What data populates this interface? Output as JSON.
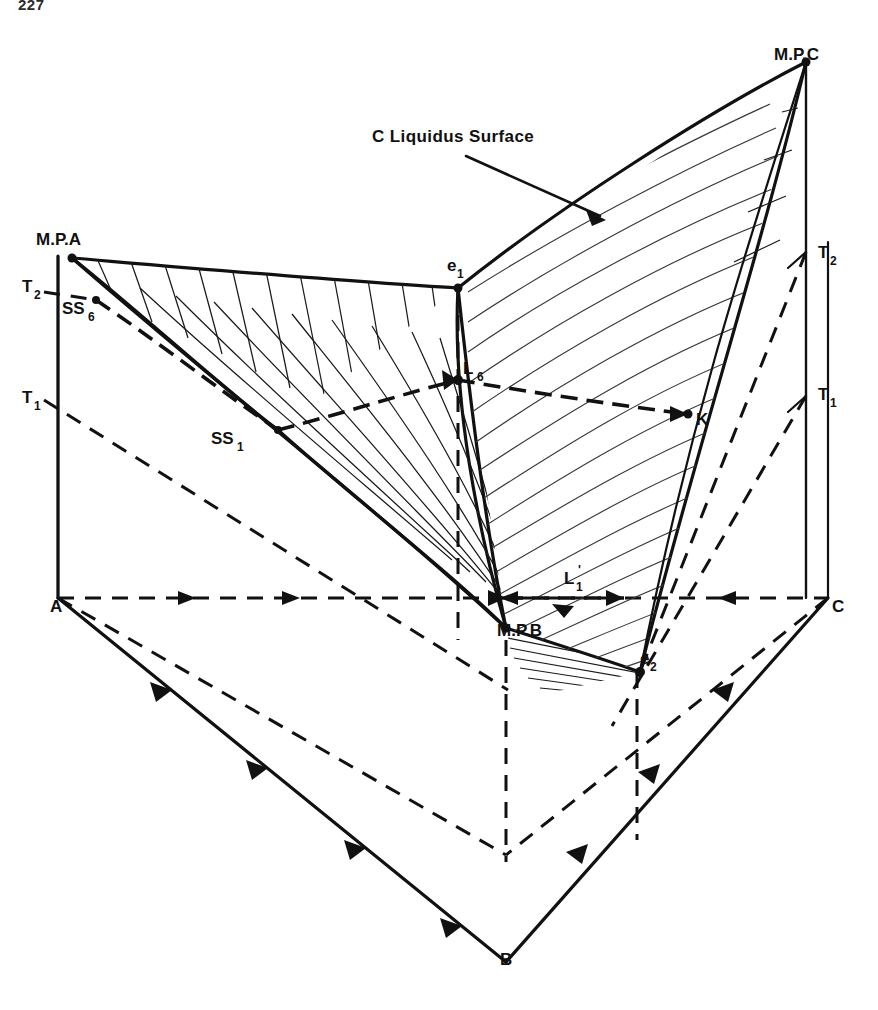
{
  "page": {
    "number": "227",
    "width": 878,
    "height": 1010
  },
  "figure": {
    "annotation": {
      "text": "C Liquidus Surface",
      "x": 372,
      "y": 142
    },
    "apex_labels": [
      {
        "id": "mpa",
        "text": "M.P.A",
        "x": 36,
        "y": 245
      },
      {
        "id": "mpc",
        "text": "M.P.C",
        "x": 774,
        "y": 60
      },
      {
        "id": "mpb",
        "text": "M.P.B",
        "x": 497,
        "y": 636
      }
    ],
    "corner_labels": [
      {
        "id": "a",
        "text": "A",
        "x": 50,
        "y": 612
      },
      {
        "id": "b",
        "text": "B",
        "x": 500,
        "y": 965
      },
      {
        "id": "c",
        "text": "C",
        "x": 832,
        "y": 612
      }
    ],
    "isotherm_labels": [
      {
        "id": "t2-left",
        "base": "T",
        "sub": "2",
        "x": 22,
        "y": 292
      },
      {
        "id": "t1-left",
        "base": "T",
        "sub": "1",
        "x": 22,
        "y": 403
      },
      {
        "id": "t2-right",
        "base": "T",
        "sub": "2",
        "x": 818,
        "y": 258
      },
      {
        "id": "t1-right",
        "base": "T",
        "sub": "1",
        "x": 818,
        "y": 400
      }
    ],
    "point_labels": [
      {
        "id": "ss6",
        "base": "SS",
        "sub": "6",
        "prime": "",
        "x": 62,
        "y": 314
      },
      {
        "id": "ss1",
        "base": "SS",
        "sub": "1",
        "prime": "",
        "x": 211,
        "y": 444
      },
      {
        "id": "e1",
        "base": "e",
        "sub": "1",
        "prime": "",
        "x": 447,
        "y": 271
      },
      {
        "id": "e2",
        "base": "e",
        "sub": "2",
        "prime": "",
        "x": 640,
        "y": 664
      },
      {
        "id": "l6",
        "base": "L",
        "sub": "6",
        "prime": "",
        "x": 463,
        "y": 374
      },
      {
        "id": "l1p",
        "base": "L",
        "sub": "1",
        "prime": "'",
        "x": 564,
        "y": 584
      },
      {
        "id": "k",
        "base": "K",
        "sub": "",
        "prime": "",
        "x": 686,
        "y": 421
      }
    ],
    "colors": {
      "ink": "#111111",
      "paper": "#ffffff",
      "hatch": "#1a1a1a"
    },
    "legend_notes": [
      "Solid lines: liquidus boundaries and prism edges",
      "Dashed lines: isothermal sections and hidden edges",
      "Hatched fans: A and C liquidus surfaces"
    ]
  }
}
